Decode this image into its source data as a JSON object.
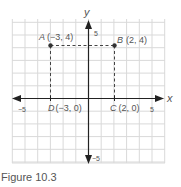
{
  "figure": {
    "caption": "Figure 10.3",
    "axes": {
      "x_label": "x",
      "y_label": "y",
      "x_min_tick": "−5",
      "x_max_tick": "5",
      "y_max_tick": "5",
      "y_min_tick": "−5"
    },
    "points": [
      {
        "name": "A",
        "coords": "(−3, 4)",
        "x": -3,
        "y": 4
      },
      {
        "name": "B",
        "coords": "(2, 4)",
        "x": 2,
        "y": 4
      },
      {
        "name": "C",
        "coords": "(2, 0)",
        "x": 2,
        "y": 0
      },
      {
        "name": "D",
        "coords": "(−3, 0)",
        "x": -3,
        "y": 0
      }
    ],
    "colors": {
      "grid": "#d6d6d6",
      "axis": "#222222",
      "dashed": "#444444",
      "label": "#555555"
    }
  }
}
